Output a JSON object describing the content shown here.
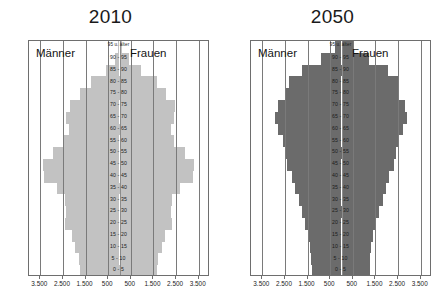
{
  "chart_data": {
    "type": "bar",
    "chart_kind": "population-pyramid",
    "grid": true,
    "legend_position": "none",
    "xlabel": "",
    "ylabel": "",
    "xlim": [
      -4000,
      4000
    ],
    "x_tick_values": [
      -3500,
      -2500,
      -1500,
      -500,
      500,
      1500,
      2500,
      3500
    ],
    "x_tick_labels": [
      "3.500",
      "2.500",
      "1.500",
      "500",
      "500",
      "1.500",
      "2.500",
      "3.500"
    ],
    "categories": [
      "0 - 5",
      "5 - 10",
      "10 - 15",
      "15 - 20",
      "20 - 25",
      "25 - 30",
      "30 - 35",
      "35 - 40",
      "40 - 45",
      "45 - 50",
      "50 - 55",
      "55 - 60",
      "60 - 65",
      "65 - 70",
      "70 - 75",
      "75 - 80",
      "80 - 85",
      "85 - 90",
      "90 - 95",
      "95 u. älter"
    ],
    "group_labels": {
      "male": "Männer",
      "female": "Frauen"
    },
    "panels": [
      {
        "title": "2010",
        "color": "#c2c2c2",
        "series": [
          {
            "name": "Männer",
            "values": [
              1750,
              1800,
              1950,
              2100,
              2400,
              2350,
              2400,
              2750,
              3350,
              3400,
              2950,
              2450,
              2250,
              2350,
              2200,
              1750,
              1250,
              600,
              210,
              60
            ]
          },
          {
            "name": "Frauen",
            "values": [
              1660,
              1710,
              1860,
              2000,
              2300,
              2260,
              2320,
              2660,
              3250,
              3300,
              2880,
              2430,
              2270,
              2430,
              2450,
              2050,
              1650,
              950,
              400,
              130
            ]
          }
        ]
      },
      {
        "title": "2050",
        "color": "#6b6b6b",
        "series": [
          {
            "name": "Männer",
            "values": [
              1300,
              1330,
              1390,
              1450,
              1600,
              1750,
              1900,
              2050,
              2200,
              2400,
              2500,
              2600,
              2800,
              2950,
              2800,
              2450,
              2300,
              1750,
              900,
              300
            ]
          },
          {
            "name": "Frauen",
            "values": [
              1240,
              1270,
              1320,
              1380,
              1520,
              1670,
              1820,
              1970,
              2120,
              2320,
              2420,
              2520,
              2720,
              2900,
              2800,
              2520,
              2500,
              2050,
              1200,
              500
            ]
          }
        ]
      }
    ]
  }
}
